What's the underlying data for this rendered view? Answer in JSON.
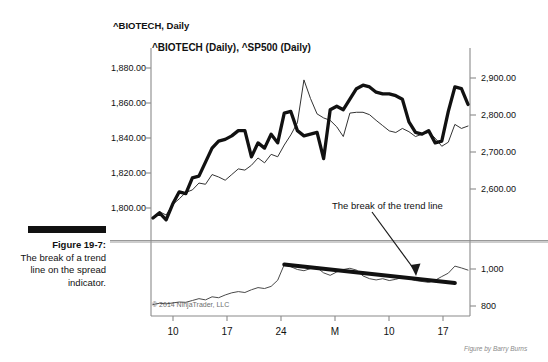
{
  "figure": {
    "caption_label": "Figure 19-7:",
    "caption_body": "The break of a trend line on the spread indicator.",
    "credit": "Figure by Barry Burns",
    "watermark": "© 2014 NinjaTrader, LLC"
  },
  "chart": {
    "title": "^BIOTECH, Daily",
    "series_title": "^BIOTECH (Daily), ^SP500 (Daily)",
    "annotation": "The break of the trend line",
    "colors": {
      "biotech_line": "#111111",
      "sp500_line": "#333333",
      "axis": "#888888",
      "trend_line": "#111111",
      "watermark": "#6e6e6e",
      "background": "#ffffff"
    }
  },
  "chart_data": {
    "type": "line",
    "title": "^BIOTECH, Daily",
    "xlabel": "",
    "grid": false,
    "legend": "none",
    "panels": [
      {
        "name": "price-panel",
        "ylabel_left": "",
        "ylabel_right": "",
        "left_axis_ticks": [
          "1,880.00",
          "1,860.00",
          "1,840.00",
          "1,820.00",
          "1,800.00"
        ],
        "left_axis_values": [
          1880,
          1860,
          1840,
          1820,
          1800
        ],
        "right_axis_ticks": [
          "2,900.00",
          "2,800.00",
          "2,700.00",
          "2,600.00"
        ],
        "right_axis_values": [
          2900,
          2800,
          2700,
          2600
        ],
        "ylim_left": [
          1790,
          1893
        ],
        "ylim_right": [
          2530,
          2975
        ],
        "series": [
          {
            "name": "^BIOTECH (Daily)",
            "axis": "left",
            "style": "thick",
            "values": [
              1798,
              1801,
              1797,
              1806,
              1813,
              1812,
              1821,
              1822,
              1830,
              1838,
              1842,
              1843,
              1845,
              1848,
              1848,
              1833,
              1841,
              1838,
              1846,
              1841,
              1858,
              1859,
              1848,
              1845,
              1846,
              1847,
              1832,
              1860,
              1862,
              1860,
              1866,
              1872,
              1874,
              1873,
              1870,
              1869,
              1869,
              1868,
              1866,
              1853,
              1847,
              1846,
              1848,
              1841,
              1842,
              1859,
              1873,
              1872,
              1863
            ]
          },
          {
            "name": "^SP500 (Daily)",
            "axis": "right",
            "style": "thin",
            "values": [
              2565,
              2580,
              2572,
              2598,
              2612,
              2628,
              2634,
              2651,
              2648,
              2672,
              2666,
              2658,
              2672,
              2686,
              2683,
              2695,
              2713,
              2701,
              2722,
              2716,
              2745,
              2770,
              2800,
              2906,
              2860,
              2822,
              2812,
              2806,
              2790,
              2766,
              2824,
              2826,
              2826,
              2820,
              2806,
              2793,
              2780,
              2776,
              2786,
              2778,
              2766,
              2772,
              2776,
              2762,
              2742,
              2752,
              2796,
              2786,
              2792
            ]
          }
        ]
      },
      {
        "name": "spread-indicator-panel",
        "right_axis_ticks": [
          "1,000",
          "800"
        ],
        "right_axis_values": [
          1000,
          800
        ],
        "ylim_right": [
          700,
          1130
        ],
        "series": [
          {
            "name": "spread",
            "style": "thin",
            "values": [
              762,
              770,
              766,
              772,
              778,
              776,
              788,
              800,
              792,
              812,
              806,
              824,
              838,
              846,
              840,
              858,
              872,
              866,
              880,
              920,
              1022,
              1008,
              990,
              982,
              996,
              1002,
              968,
              952,
              974,
              990,
              998,
              986,
              948,
              930,
              922,
              930,
              918,
              926,
              938,
              930,
              918,
              912,
              906,
              920,
              944,
              966,
              1012,
              1000,
              986
            ]
          }
        ],
        "trend_line": {
          "label": "The break of the trend line",
          "start": {
            "x_index": 20,
            "value": 1022
          },
          "end": {
            "x_index": 46,
            "value": 902
          },
          "style": "thick-descending"
        }
      }
    ],
    "x_tick_labels": [
      "10",
      "17",
      "24",
      "M",
      "10",
      "17"
    ]
  }
}
